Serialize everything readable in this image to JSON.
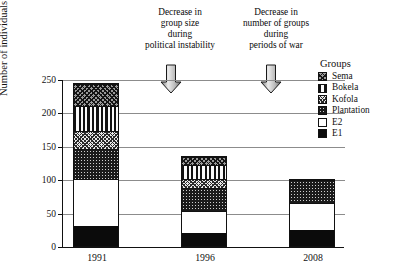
{
  "chart_data": {
    "type": "bar",
    "subtype": "stacked-bar",
    "title": "",
    "xlabel": "",
    "ylabel": "Number of individuals",
    "categories": [
      "1991",
      "1996",
      "2008"
    ],
    "ylim": [
      0,
      250
    ],
    "yticks": [
      0,
      50,
      100,
      150,
      200,
      250
    ],
    "ytick_labels": [
      "0",
      "50",
      "100",
      "150",
      "200",
      "250"
    ],
    "grid": true,
    "legend_position": "right",
    "legend_title": "Groups",
    "series": [
      {
        "name": "E1",
        "pattern": "solid-black",
        "values": [
          30,
          20,
          24
        ]
      },
      {
        "name": "E2",
        "pattern": "solid-white",
        "values": [
          70,
          32,
          40
        ]
      },
      {
        "name": "Plantation",
        "pattern": "dark-dotted",
        "values": [
          45,
          35,
          35
        ]
      },
      {
        "name": "Kofola",
        "pattern": "light-crosshatch",
        "values": [
          27,
          13,
          0
        ]
      },
      {
        "name": "Bokela",
        "pattern": "vertical-stripes",
        "values": [
          38,
          21,
          0
        ]
      },
      {
        "name": "Sema",
        "pattern": "grey-crosshatch",
        "values": [
          33,
          13,
          0
        ]
      }
    ],
    "totals": [
      243,
      134,
      99
    ],
    "annotations": [
      {
        "id": "annotation-political-instability",
        "lines": [
          "Decrease in",
          "group size",
          "during",
          "political instability"
        ],
        "marker": "down-arrow"
      },
      {
        "id": "annotation-periods-of-war",
        "lines": [
          "Decrease in",
          "number of groups",
          "during",
          "periods of war"
        ],
        "marker": "down-arrow"
      }
    ]
  },
  "legend": {
    "title": "Groups",
    "items": [
      {
        "label": "Sema"
      },
      {
        "label": "Bokela"
      },
      {
        "label": "Kofola"
      },
      {
        "label": "Plantation"
      },
      {
        "label": "E2"
      },
      {
        "label": "E1"
      }
    ]
  },
  "colors": {
    "axis": "#111111",
    "gridline": "#8c8c8c",
    "background": "#ffffff",
    "arrow_light": "#e4e4e4",
    "arrow_dark": "#6f6f6f"
  }
}
